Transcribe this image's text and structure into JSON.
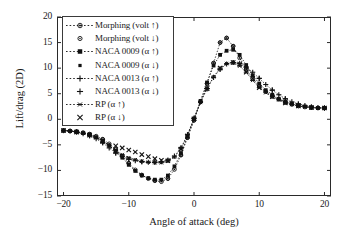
{
  "chart_data": {
    "type": "scatter",
    "title": "",
    "xlabel": "Angle of attack (deg)",
    "ylabel": "Lift/drag (2D)",
    "xlim": [
      -21,
      21
    ],
    "ylim": [
      -15,
      20
    ],
    "xticks": [
      -20,
      -10,
      0,
      10,
      20
    ],
    "yticks": [
      -15,
      -10,
      -5,
      0,
      5,
      10,
      15,
      20
    ],
    "xtick_labels": [
      "−20",
      "−10",
      "0",
      "10",
      "20"
    ],
    "ytick_labels": [
      "−15",
      "−10",
      "−5",
      "0",
      "5",
      "10",
      "15",
      "20"
    ],
    "grid": false,
    "legend_position": "upper-left",
    "series": [
      {
        "name": "Morphing (volt ↑)",
        "marker": "circle-dot",
        "linestyle": "dotted",
        "x": [
          -20,
          -19,
          -18,
          -17,
          -16,
          -15,
          -14,
          -13,
          -12,
          -11,
          -10,
          -9,
          -8,
          -7,
          -6,
          -5,
          -4,
          -3,
          -2,
          -1,
          0,
          1,
          2,
          3,
          4,
          5,
          6,
          7,
          8,
          9,
          10,
          11,
          12,
          13,
          14,
          15,
          16,
          17,
          18,
          19,
          20
        ],
        "y": [
          -2.2,
          -2.3,
          -2.4,
          -2.6,
          -2.9,
          -3.3,
          -3.9,
          -4.8,
          -5.9,
          -7.2,
          -8.6,
          -9.9,
          -10.9,
          -11.6,
          -12.0,
          -12.2,
          -11.6,
          -9.8,
          -7.0,
          -3.6,
          -0.2,
          3.4,
          7.0,
          11.0,
          15.0,
          15.9,
          14.3,
          12.0,
          9.8,
          8.0,
          6.5,
          5.4,
          4.5,
          3.9,
          3.3,
          2.9,
          2.6,
          2.4,
          2.3,
          2.2,
          2.2
        ]
      },
      {
        "name": "Morphing (volt ↓)",
        "marker": "open-circle",
        "linestyle": "none",
        "x": [
          -20,
          -18,
          -16,
          -14,
          -12,
          -10,
          -8,
          -6,
          -4,
          -2,
          -1,
          0,
          1,
          2,
          3,
          4,
          5,
          6,
          8,
          10,
          12,
          14,
          16,
          18,
          20
        ],
        "y": [
          -2.2,
          -2.4,
          -2.9,
          -3.9,
          -5.9,
          -8.6,
          -10.9,
          -12.0,
          -11.6,
          -7.0,
          -3.6,
          -0.2,
          3.4,
          7.0,
          11.0,
          15.0,
          15.9,
          14.3,
          9.8,
          6.5,
          4.5,
          3.3,
          2.6,
          2.3,
          2.2
        ]
      },
      {
        "name": "NACA 0009 (α ↑)",
        "marker": "square",
        "linestyle": "dotted",
        "x": [
          -20,
          -19,
          -18,
          -17,
          -16,
          -15,
          -14,
          -13,
          -12,
          -11,
          -10,
          -9,
          -8,
          -7,
          -6,
          -5,
          -4,
          -3,
          -2,
          -1,
          0,
          1,
          2,
          3,
          4,
          5,
          6,
          7,
          8,
          9,
          10,
          11,
          12,
          13,
          14,
          15,
          16,
          17,
          18,
          19,
          20
        ],
        "y": [
          -2.2,
          -2.3,
          -2.5,
          -2.7,
          -3.0,
          -3.5,
          -4.2,
          -5.1,
          -6.2,
          -7.5,
          -8.9,
          -10.1,
          -11.0,
          -11.5,
          -11.8,
          -11.8,
          -11.0,
          -9.2,
          -6.6,
          -3.4,
          0.0,
          3.6,
          7.2,
          10.5,
          12.6,
          13.4,
          13.6,
          12.6,
          10.6,
          8.6,
          7.0,
          5.7,
          4.8,
          4.0,
          3.4,
          3.0,
          2.7,
          2.5,
          2.3,
          2.2,
          2.2
        ]
      },
      {
        "name": "NACA 0009 (α ↓)",
        "marker": "small-square",
        "linestyle": "none",
        "x": [
          -20,
          -18,
          -16,
          -14,
          -12,
          -10,
          -8,
          -6,
          -4,
          -2,
          0,
          2,
          4,
          5,
          6,
          8,
          10,
          12,
          14,
          16,
          18,
          20
        ],
        "y": [
          -2.2,
          -2.5,
          -3.0,
          -4.2,
          -6.2,
          -8.9,
          -11.0,
          -11.8,
          -11.0,
          -6.6,
          0.0,
          7.2,
          12.6,
          13.4,
          13.6,
          10.6,
          7.0,
          4.8,
          3.4,
          2.7,
          2.3,
          2.2
        ]
      },
      {
        "name": "NACA 0013 (α ↑)",
        "marker": "plus",
        "linestyle": "dotted",
        "x": [
          -20,
          -19,
          -18,
          -17,
          -16,
          -15,
          -14,
          -13,
          -12,
          -11,
          -10,
          -9,
          -8,
          -7,
          -6,
          -5,
          -4,
          -3,
          -2,
          -1,
          0,
          1,
          2,
          3,
          4,
          5,
          6,
          7,
          8,
          9,
          10,
          11,
          12,
          13,
          14,
          15,
          16,
          17,
          18,
          19,
          20
        ],
        "y": [
          -2.2,
          -2.3,
          -2.5,
          -2.8,
          -3.2,
          -3.8,
          -4.6,
          -5.6,
          -6.6,
          -7.3,
          -7.8,
          -8.1,
          -8.3,
          -8.4,
          -8.4,
          -8.3,
          -8.0,
          -7.2,
          -5.6,
          -3.0,
          0.2,
          3.4,
          6.0,
          8.2,
          9.8,
          10.8,
          11.1,
          10.9,
          10.2,
          9.2,
          8.0,
          6.8,
          5.7,
          4.8,
          4.0,
          3.4,
          3.0,
          2.7,
          2.4,
          2.3,
          2.2
        ]
      },
      {
        "name": "NACA 0013 (α ↓)",
        "marker": "plus",
        "linestyle": "none",
        "x": [
          -20,
          -18,
          -16,
          -14,
          -12,
          -10,
          -8,
          -6,
          -4,
          -2,
          0,
          2,
          4,
          6,
          8,
          10,
          12,
          14,
          16,
          18,
          20
        ],
        "y": [
          -2.2,
          -2.5,
          -3.2,
          -4.6,
          -6.6,
          -7.8,
          -8.3,
          -8.4,
          -8.0,
          -5.6,
          0.2,
          6.0,
          9.8,
          11.1,
          10.2,
          8.0,
          5.7,
          4.0,
          3.0,
          2.4,
          2.2
        ]
      },
      {
        "name": "RP (α ↑)",
        "marker": "asterisk",
        "linestyle": "dotted",
        "x": [
          -20,
          -19,
          -18,
          -17,
          -16,
          -15,
          -14,
          -13,
          -12,
          -11,
          -10,
          -9,
          -8,
          -7,
          -6,
          -5,
          -4,
          -3,
          -2,
          -1,
          0,
          1,
          2,
          3,
          4,
          5,
          6,
          7,
          8,
          9,
          10,
          11,
          12,
          13,
          14,
          15,
          16,
          17,
          18,
          19,
          20
        ],
        "y": [
          -2.2,
          -2.3,
          -2.5,
          -2.7,
          -3.1,
          -3.6,
          -4.3,
          -5.2,
          -6.1,
          -6.9,
          -7.5,
          -7.9,
          -8.2,
          -8.4,
          -8.5,
          -8.5,
          -8.2,
          -7.4,
          -5.8,
          -3.1,
          0.1,
          3.3,
          6.0,
          8.3,
          10.0,
          10.9,
          11.1,
          10.4,
          9.2,
          7.6,
          6.2,
          5.2,
          4.4,
          3.8,
          3.2,
          2.9,
          2.6,
          2.4,
          2.3,
          2.2,
          2.2
        ]
      },
      {
        "name": "RP (α ↓)",
        "marker": "cross",
        "linestyle": "none",
        "x": [
          -20,
          -18,
          -16,
          -14,
          -12,
          -11,
          -10,
          -9,
          -8,
          -7,
          -6,
          -5,
          -4,
          -2,
          0,
          2,
          4,
          6,
          7,
          8,
          9,
          10,
          12,
          14,
          16,
          18,
          20
        ],
        "y": [
          -2.2,
          -2.5,
          -3.1,
          -4.3,
          -5.2,
          -5.6,
          -6.0,
          -6.4,
          -6.9,
          -7.3,
          -7.7,
          -8.0,
          -8.1,
          -5.8,
          0.1,
          6.0,
          10.0,
          11.1,
          10.8,
          9.2,
          8.0,
          6.2,
          4.4,
          3.2,
          2.6,
          2.3,
          2.2
        ]
      }
    ]
  }
}
